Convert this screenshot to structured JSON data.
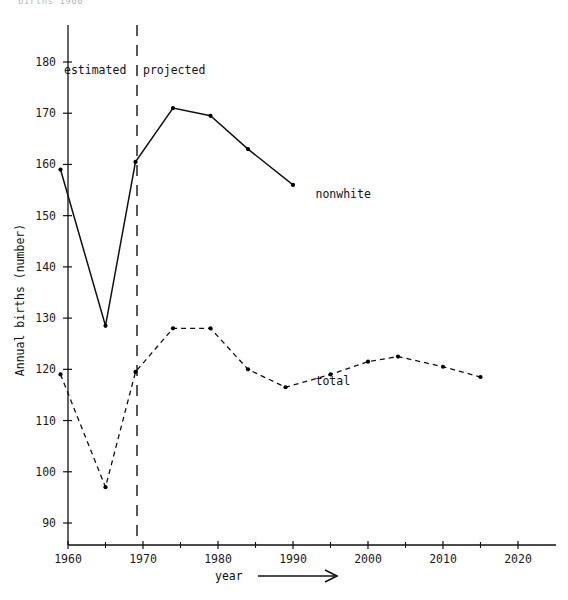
{
  "figure": {
    "cut_off_header": "births     1960",
    "annotations": {
      "estimated": "estimated",
      "projected": "projected",
      "divider_year": 1969
    }
  },
  "chart_data": {
    "type": "line",
    "title": "",
    "xlabel": "year",
    "xlabel_suffix_arrow": "⟶",
    "ylabel": "Annual births (number)",
    "xlim": [
      1957,
      2023
    ],
    "ylim": [
      86,
      184
    ],
    "grid": false,
    "legend": "inline-labels",
    "xticks": [
      1960,
      1970,
      1980,
      1990,
      2000,
      2010,
      2020
    ],
    "xtick_labels": [
      "1960",
      "1970",
      "1980",
      "1990",
      "2000",
      "2010",
      "2020"
    ],
    "xminor_ticks": [
      1965,
      1975,
      1985,
      1995,
      2005,
      2015
    ],
    "yticks": [
      90,
      100,
      110,
      120,
      130,
      140,
      150,
      160,
      170,
      180
    ],
    "ytick_labels": [
      "90",
      "100",
      "110",
      "120",
      "130",
      "140",
      "150",
      "160",
      "170",
      "180"
    ],
    "series": [
      {
        "name": "nonwhite",
        "label": "nonwhite",
        "style": "solid",
        "marker": "dot",
        "x": [
          1959,
          1965,
          1969,
          1974,
          1979,
          1984,
          1990
        ],
        "values": [
          159.0,
          128.5,
          160.5,
          171.0,
          169.5,
          163.0,
          156.0
        ]
      },
      {
        "name": "total",
        "label": "total",
        "style": "dashed",
        "marker": "dot",
        "x": [
          1959,
          1965,
          1969,
          1974,
          1979,
          1984,
          1989,
          1995,
          2000,
          2004,
          2010,
          2015
        ],
        "values": [
          119.0,
          97.0,
          119.5,
          128.0,
          128.0,
          120.0,
          116.5,
          119.0,
          121.5,
          122.5,
          120.5,
          118.5
        ]
      }
    ],
    "series_label_positions": [
      {
        "name": "nonwhite",
        "x": 1993,
        "y": 153.5
      },
      {
        "name": "total",
        "x": 1993,
        "y": 117.0
      }
    ]
  }
}
